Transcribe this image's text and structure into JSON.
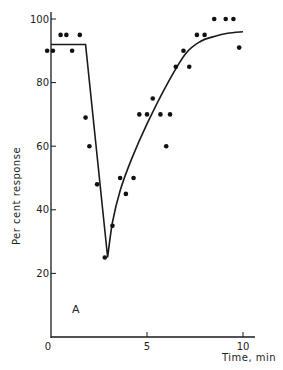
{
  "chart_data": {
    "type": "scatter",
    "title": "",
    "panel_label": "A",
    "xlabel": "Time, min",
    "ylabel": "Per cent response",
    "xlim": [
      0,
      10
    ],
    "ylim": [
      0,
      100
    ],
    "x_ticks": [
      0,
      5,
      10
    ],
    "x_tick_labels": [
      "0",
      "5",
      "10"
    ],
    "y_ticks": [
      20,
      40,
      60,
      80,
      100
    ],
    "y_tick_labels": [
      "20",
      "40",
      "60",
      "80",
      "100"
    ],
    "grid": false,
    "legend": null,
    "series": [
      {
        "name": "observed",
        "kind": "points",
        "x": [
          -0.2,
          0.1,
          0.5,
          0.8,
          1.1,
          1.5,
          1.8,
          2.0,
          2.4,
          2.8,
          3.2,
          3.6,
          3.9,
          4.3,
          4.6,
          5.0,
          5.3,
          5.7,
          6.0,
          6.2,
          6.5,
          6.9,
          7.2,
          7.6,
          8.0,
          8.5,
          9.1,
          9.5,
          9.8
        ],
        "y": [
          90,
          90,
          95,
          95,
          90,
          95,
          69,
          60,
          48,
          25,
          35,
          50,
          45,
          50,
          70,
          70,
          75,
          70,
          60,
          70,
          85,
          90,
          85,
          95,
          95,
          100,
          100,
          100,
          91
        ]
      },
      {
        "name": "fitted",
        "kind": "line",
        "x": [
          0,
          1.8,
          2.95,
          3.2,
          3.6,
          4.2,
          5.0,
          6.0,
          7.0,
          7.8,
          8.5,
          9.2,
          10.0
        ],
        "y": [
          92,
          92,
          25,
          36,
          46,
          56,
          67,
          79,
          89,
          93,
          94.5,
          95.5,
          96
        ]
      }
    ]
  }
}
